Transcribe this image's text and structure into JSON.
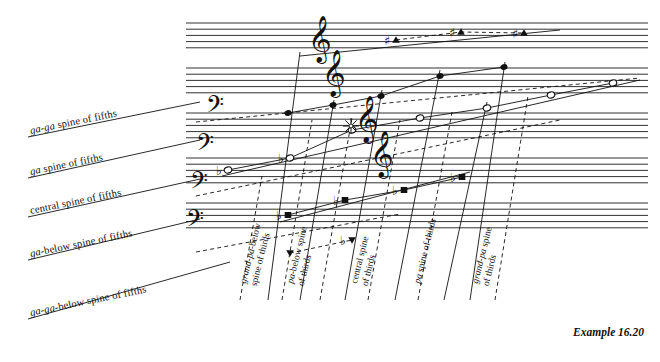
{
  "figure": {
    "caption": "Example 16.20",
    "background": "#ffffff",
    "ink": "#111111",
    "width": 660,
    "height": 362
  },
  "staff_system": {
    "description": "five five-line staves stacked vertically",
    "staff_count": 5,
    "lines_per_staff": 5,
    "line_spacing_px": 6.2,
    "staff_gap_px": 14,
    "left_px": 186,
    "right_px": 648,
    "tops_px": [
      23,
      68,
      113,
      158,
      203
    ],
    "slant_deg": 0
  },
  "clefs": [
    {
      "type": "treble-clef",
      "glyph": "𝄞",
      "x": 308,
      "y": 52,
      "staff": 1
    },
    {
      "type": "treble-clef",
      "glyph": "𝄞",
      "x": 322,
      "y": 86,
      "staff": 2
    },
    {
      "type": "treble-clef",
      "glyph": "𝄞",
      "x": 355,
      "y": 132,
      "staff": 3
    },
    {
      "type": "treble-clef",
      "glyph": "𝄞",
      "x": 370,
      "y": 167,
      "staff": 4
    },
    {
      "type": "bass-clef",
      "glyph": "𝄢",
      "x": 206,
      "y": 117,
      "staff": 2
    },
    {
      "type": "bass-clef",
      "glyph": "𝄢",
      "x": 196,
      "y": 155,
      "staff": 3
    },
    {
      "type": "bass-clef",
      "glyph": "𝄢",
      "x": 190,
      "y": 193,
      "staff": 4
    },
    {
      "type": "bass-clef",
      "glyph": "𝄢",
      "x": 186,
      "y": 231,
      "staff": 5
    }
  ],
  "fifth_spines": {
    "label_suffix": "spine of fifths",
    "items": [
      {
        "id": "ga-ga",
        "italic": "ga-ga",
        "rest": " spine of fifths",
        "label": "ga-ga spine of fifths",
        "label_x": 30,
        "label_y": 125,
        "angle": -11.5,
        "leader": {
          "x1": 28,
          "y1": 137,
          "x2": 200,
          "y2": 102
        }
      },
      {
        "id": "ga",
        "italic": "ga",
        "rest": " spine of fifths",
        "label": "ga spine of fifths",
        "label_x": 30,
        "label_y": 166,
        "angle": -11.5,
        "leader": {
          "x1": 28,
          "y1": 178,
          "x2": 200,
          "y2": 140
        }
      },
      {
        "id": "central",
        "italic": "",
        "rest": "central spine of fifths",
        "label": "central spine of fifths",
        "label_x": 30,
        "label_y": 205,
        "angle": -11.5,
        "leader": {
          "x1": 28,
          "y1": 217,
          "x2": 200,
          "y2": 179
        }
      },
      {
        "id": "ga-below",
        "italic": "ga",
        "rest": "-below spine of fifths",
        "label": "ga-below spine of fifths",
        "label_x": 30,
        "label_y": 248,
        "angle": -11.5,
        "leader": {
          "x1": 28,
          "y1": 260,
          "x2": 200,
          "y2": 219
        }
      },
      {
        "id": "ga-ga-below",
        "italic": "ga-ga",
        "rest": "-below spine of fifths",
        "label": "ga-ga-below spine of fifths",
        "label_x": 30,
        "label_y": 307,
        "angle": -11.5,
        "leader": {
          "x1": 28,
          "y1": 319,
          "x2": 230,
          "y2": 262
        }
      }
    ]
  },
  "third_spines": {
    "label_suffix": "spine of thirds",
    "items": [
      {
        "id": "grand-pa-below",
        "line1_italic": "grand-pa",
        "line1_rest": "-below",
        "line2": "spine of thirds",
        "label": "grand-pa-below spine of thirds",
        "x": 238,
        "y": 282,
        "angle": 76
      },
      {
        "id": "pa-below",
        "line1_italic": "pa",
        "line1_rest": "-below spine",
        "line2": "of thirds",
        "label": "pa-below spine of thirds",
        "x": 285,
        "y": 282,
        "angle": 76
      },
      {
        "id": "central",
        "line1_italic": "",
        "line1_rest": "central spine",
        "line2": "of thirds",
        "label": "central spine of thirds",
        "x": 349,
        "y": 282,
        "angle": 76
      },
      {
        "id": "pa",
        "line1_italic": "pa",
        "line1_rest": " spine of thirds",
        "line2": "",
        "label": "pa spine of thirds",
        "x": 412,
        "y": 282,
        "angle": 76
      },
      {
        "id": "grand-pa",
        "line1_italic": "grand-pa",
        "line1_rest": " spine",
        "line2": "of thirds",
        "label": "grand-pa spine of thirds",
        "x": 470,
        "y": 282,
        "angle": 76
      }
    ]
  },
  "center_marker": {
    "name": "central-tone-starburst",
    "x": 351,
    "y": 126,
    "rays": 8,
    "radius": 8
  },
  "noteheads": {
    "shape_legend": {
      "filled-circle": "central spine of fifths tones",
      "open-diamond": "ga / upper spine tones",
      "filled-square": "ga-below / lower spine tones",
      "filled-triangle": "ga-ga spine tones",
      "inverted-triangle": "ga-ga-below spine tones"
    },
    "accidentals": {
      "sharp": "♯",
      "flat": "♭",
      "double-sharp": "♯♯"
    },
    "items": [
      {
        "shape": "filled-triangle",
        "x": 396,
        "y": 40,
        "accidental": "♯",
        "spine": "ga-ga"
      },
      {
        "shape": "filled-triangle",
        "x": 461,
        "y": 32,
        "accidental": "♯",
        "spine": "ga-ga"
      },
      {
        "shape": "filled-triangle",
        "x": 524,
        "y": 33,
        "accidental": "♯",
        "spine": "ga-ga"
      },
      {
        "shape": "open-diamond",
        "x": 228,
        "y": 170,
        "accidental": "♭",
        "spine": "ga"
      },
      {
        "shape": "open-diamond",
        "x": 290,
        "y": 158,
        "accidental": "♭",
        "spine": "ga"
      },
      {
        "shape": "open-diamond",
        "x": 352,
        "y": 130,
        "accidental": "",
        "spine": "ga"
      },
      {
        "shape": "open-diamond",
        "x": 420,
        "y": 118,
        "accidental": "",
        "spine": "ga"
      },
      {
        "shape": "open-diamond",
        "x": 487,
        "y": 108,
        "accidental": "",
        "spine": "ga"
      },
      {
        "shape": "open-diamond",
        "x": 551,
        "y": 95,
        "accidental": "",
        "spine": "ga"
      },
      {
        "shape": "open-diamond",
        "x": 613,
        "y": 83,
        "accidental": "",
        "spine": "ga"
      },
      {
        "shape": "filled-circle",
        "x": 288,
        "y": 113,
        "accidental": "",
        "spine": "central"
      },
      {
        "shape": "filled-circle",
        "x": 333,
        "y": 105,
        "accidental": "",
        "spine": "central"
      },
      {
        "shape": "filled-circle",
        "x": 381,
        "y": 96,
        "accidental": "",
        "spine": "central"
      },
      {
        "shape": "filled-circle",
        "x": 440,
        "y": 76,
        "accidental": "",
        "spine": "central"
      },
      {
        "shape": "filled-circle",
        "x": 504,
        "y": 67,
        "accidental": "",
        "spine": "central"
      },
      {
        "shape": "filled-square",
        "x": 288,
        "y": 215,
        "accidental": "♭",
        "spine": "ga-below"
      },
      {
        "shape": "filled-square",
        "x": 345,
        "y": 200,
        "accidental": "♭",
        "spine": "ga-below"
      },
      {
        "shape": "filled-square",
        "x": 404,
        "y": 190,
        "accidental": "♭",
        "spine": "ga-below"
      },
      {
        "shape": "filled-square",
        "x": 462,
        "y": 177,
        "accidental": "♭",
        "spine": "ga-below"
      },
      {
        "shape": "inverted-triangle",
        "x": 352,
        "y": 240,
        "accidental": "♭",
        "spine": "ga-ga-below"
      },
      {
        "shape": "inverted-triangle",
        "x": 290,
        "y": 253,
        "accidental": "",
        "spine": "ga-ga-below"
      }
    ]
  }
}
